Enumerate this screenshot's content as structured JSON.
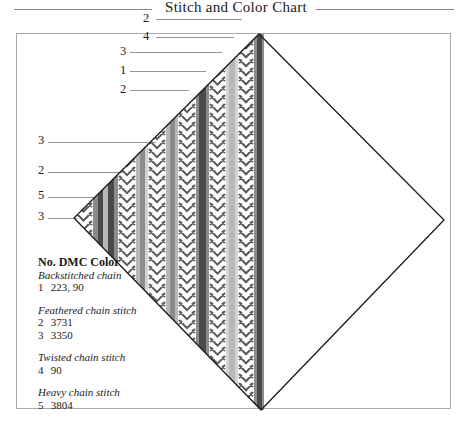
{
  "title": "Stitch and Color Chart",
  "legend": {
    "header": "No. DMC Color",
    "groups": [
      {
        "name": "Backstitched chain",
        "entries": [
          {
            "no": "1",
            "color": "223, 90"
          }
        ]
      },
      {
        "name": "Feathered chain stitch",
        "entries": [
          {
            "no": "2",
            "color": "3731"
          },
          {
            "no": "3",
            "color": "3350"
          }
        ]
      },
      {
        "name": "Twisted chain stitch",
        "entries": [
          {
            "no": "4",
            "color": "90"
          }
        ]
      },
      {
        "name": "Heavy chain stitch",
        "entries": [
          {
            "no": "5",
            "color": "3804"
          }
        ]
      }
    ]
  },
  "leaders": [
    {
      "label": "2",
      "label_x": 143,
      "label_y": 11,
      "x1": 156,
      "x2": 242,
      "y": 19
    },
    {
      "label": "4",
      "label_x": 143,
      "label_y": 29,
      "x1": 156,
      "x2": 234,
      "y": 37
    },
    {
      "label": "3",
      "label_x": 120,
      "label_y": 44,
      "x1": 130,
      "x2": 222,
      "y": 52
    },
    {
      "label": "1",
      "label_x": 120,
      "label_y": 63,
      "x1": 130,
      "x2": 206,
      "y": 71
    },
    {
      "label": "2",
      "label_x": 120,
      "label_y": 82,
      "x1": 130,
      "x2": 189,
      "y": 90
    },
    {
      "label": "3",
      "label_x": 38,
      "label_y": 133,
      "x1": 48,
      "x2": 156,
      "y": 142
    },
    {
      "label": "2",
      "label_x": 38,
      "label_y": 163,
      "x1": 48,
      "x2": 126,
      "y": 172
    },
    {
      "label": "5",
      "label_x": 38,
      "label_y": 188,
      "x1": 48,
      "x2": 96,
      "y": 197
    },
    {
      "label": "3",
      "label_x": 38,
      "label_y": 209,
      "x1": 48,
      "x2": 77,
      "y": 218
    }
  ],
  "diamond": {
    "top": [
      259,
      34
    ],
    "right": [
      444,
      220
    ],
    "bottom": [
      261,
      410
    ],
    "left": [
      74,
      218
    ],
    "outline_color": "#1a1a1a"
  },
  "colors": {
    "dark": "#4a4a4a",
    "mid": "#8c8c8c",
    "light": "#b8b8b8",
    "pale": "#d4d4d4",
    "chevron": "#5a5a5a"
  },
  "columns": [
    {
      "type": "chevron",
      "x": 74,
      "w": 19
    },
    {
      "type": "stripe",
      "x": 93,
      "w": 5,
      "shade": "mid"
    },
    {
      "type": "stripe",
      "x": 98,
      "w": 5,
      "shade": "dark"
    },
    {
      "type": "stripe",
      "x": 103,
      "w": 5,
      "shade": "light"
    },
    {
      "type": "stripe",
      "x": 108,
      "w": 6,
      "shade": "dark"
    },
    {
      "type": "stripe",
      "x": 114,
      "w": 4,
      "shade": "mid"
    },
    {
      "type": "chevron",
      "x": 118,
      "w": 18
    },
    {
      "type": "stripe",
      "x": 136,
      "w": 4,
      "shade": "light"
    },
    {
      "type": "stripe",
      "x": 140,
      "w": 5,
      "shade": "mid"
    },
    {
      "type": "stripe",
      "x": 145,
      "w": 3,
      "shade": "pale"
    },
    {
      "type": "chevron",
      "x": 148,
      "w": 18
    },
    {
      "type": "stripe",
      "x": 166,
      "w": 4,
      "shade": "light"
    },
    {
      "type": "stripe",
      "x": 170,
      "w": 5,
      "shade": "mid"
    },
    {
      "type": "stripe",
      "x": 175,
      "w": 3,
      "shade": "light"
    },
    {
      "type": "chevron",
      "x": 178,
      "w": 18
    },
    {
      "type": "stripe",
      "x": 196,
      "w": 3,
      "shade": "mid"
    },
    {
      "type": "stripe",
      "x": 199,
      "w": 7,
      "shade": "dark"
    },
    {
      "type": "stripe",
      "x": 206,
      "w": 3,
      "shade": "mid"
    },
    {
      "type": "chevron",
      "x": 209,
      "w": 17
    },
    {
      "type": "stripe",
      "x": 226,
      "w": 3,
      "shade": "pale"
    },
    {
      "type": "stripe",
      "x": 229,
      "w": 6,
      "shade": "light"
    },
    {
      "type": "stripe",
      "x": 235,
      "w": 3,
      "shade": "pale"
    },
    {
      "type": "chevron",
      "x": 238,
      "w": 16
    },
    {
      "type": "stripe",
      "x": 254,
      "w": 3,
      "shade": "mid"
    },
    {
      "type": "stripe",
      "x": 257,
      "w": 5,
      "shade": "dark"
    },
    {
      "type": "stripe",
      "x": 262,
      "w": 2,
      "shade": "mid"
    }
  ]
}
